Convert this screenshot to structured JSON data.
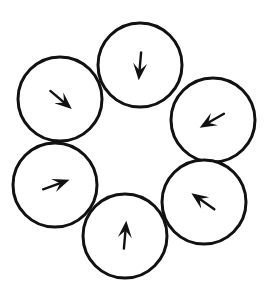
{
  "diagram": {
    "title": "",
    "colors": {
      "stroke": "#111111",
      "fill": "#ffffff",
      "arrow": "#111111"
    },
    "circles": [
      {
        "id": "top",
        "arrow_direction_deg": 95
      },
      {
        "id": "upper-left",
        "arrow_direction_deg": 40
      },
      {
        "id": "upper-right",
        "arrow_direction_deg": 150
      },
      {
        "id": "lower-left",
        "arrow_direction_deg": -20
      },
      {
        "id": "lower-right",
        "arrow_direction_deg": -145
      },
      {
        "id": "bottom",
        "arrow_direction_deg": -85
      }
    ]
  }
}
